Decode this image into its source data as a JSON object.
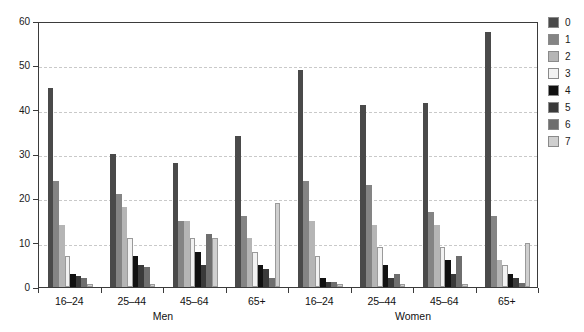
{
  "chart_data": {
    "type": "bar",
    "title": "",
    "subtitle": "",
    "xlabel": "",
    "ylabel": "",
    "ylim": [
      0,
      60
    ],
    "yticks": [
      0,
      10,
      20,
      30,
      40,
      50,
      60
    ],
    "ytick_labels": [
      "0",
      "10",
      "20",
      "30",
      "40",
      "50",
      "60"
    ],
    "grid": true,
    "grid_axis": "y",
    "legend_position": "right",
    "legend_title": "",
    "categories": [
      "16–24",
      "25–44",
      "45–64",
      "65+",
      "16–24",
      "25–44",
      "45–64",
      "65+"
    ],
    "super_categories": [
      {
        "label": "Men",
        "group_span": [
          0,
          3
        ]
      },
      {
        "label": "Women",
        "group_span": [
          4,
          7
        ]
      }
    ],
    "series": [
      {
        "name": "0",
        "color": "#4a4a4a",
        "values": [
          45.0,
          30.0,
          28.0,
          34.0,
          49.0,
          41.0,
          41.5,
          57.5
        ]
      },
      {
        "name": "1",
        "color": "#848484",
        "values": [
          24.0,
          21.0,
          15.0,
          16.0,
          24.0,
          23.0,
          17.0,
          16.0
        ]
      },
      {
        "name": "2",
        "color": "#b5b5b5",
        "values": [
          14.0,
          18.0,
          15.0,
          11.0,
          15.0,
          14.0,
          14.0,
          6.0
        ]
      },
      {
        "name": "3",
        "color": "#f2f2f2",
        "values": [
          7.0,
          11.0,
          11.0,
          8.0,
          7.0,
          9.0,
          9.0,
          5.0
        ]
      },
      {
        "name": "4",
        "color": "#111111",
        "values": [
          3.0,
          7.0,
          8.0,
          5.0,
          2.0,
          5.0,
          6.0,
          3.0
        ]
      },
      {
        "name": "5",
        "color": "#3a3a3a",
        "values": [
          2.5,
          5.0,
          5.0,
          4.0,
          1.2,
          2.0,
          3.0,
          2.0
        ]
      },
      {
        "name": "6",
        "color": "#6e6e6e",
        "values": [
          2.0,
          4.5,
          12.0,
          2.0,
          1.2,
          3.0,
          7.0,
          1.0
        ]
      },
      {
        "name": "7",
        "color": "#cfcfcf",
        "values": [
          0.6,
          0.6,
          11.0,
          19.0,
          0.6,
          0.6,
          0.6,
          10.0
        ]
      }
    ]
  },
  "legend": {
    "items": [
      {
        "label": "0"
      },
      {
        "label": "1"
      },
      {
        "label": "2"
      },
      {
        "label": "3"
      },
      {
        "label": "4"
      },
      {
        "label": "5"
      },
      {
        "label": "6"
      },
      {
        "label": "7"
      }
    ]
  },
  "colors": {
    "axis": "#3b3b3b",
    "gridline": "#c9c9c9",
    "text": "#111111",
    "background": "#ffffff",
    "swatch_border": "#8a8a8a"
  }
}
